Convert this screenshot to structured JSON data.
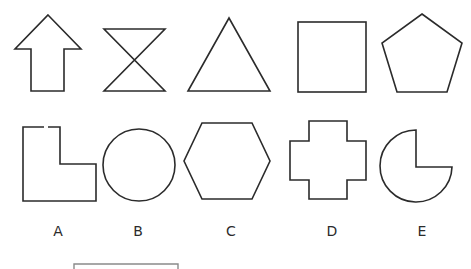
{
  "figure": {
    "stroke_color": "#2b2b2b",
    "bracket_color": "#8a8a8a",
    "top_row": [
      {
        "name": "up-arrow",
        "shape": "arrow"
      },
      {
        "name": "hourglass",
        "shape": "hourglass"
      },
      {
        "name": "triangle",
        "shape": "triangle"
      },
      {
        "name": "square",
        "shape": "square"
      },
      {
        "name": "pentagon",
        "shape": "pentagon"
      }
    ],
    "options": [
      {
        "label": "A",
        "shape": "l-shape"
      },
      {
        "label": "B",
        "shape": "circle"
      },
      {
        "label": "C",
        "shape": "hexagon"
      },
      {
        "label": "D",
        "shape": "cross"
      },
      {
        "label": "E",
        "shape": "three-quarter-circle"
      }
    ]
  }
}
